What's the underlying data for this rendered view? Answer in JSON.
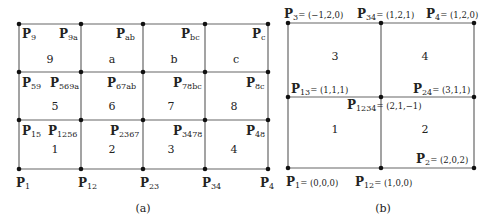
{
  "figure_a": {
    "caption": "(a)",
    "x": [
      19,
      81,
      143,
      205,
      268
    ],
    "y": [
      24,
      72,
      120,
      169
    ],
    "cells": [
      {
        "label": "9",
        "x": 50,
        "y": 59
      },
      {
        "label": "a",
        "x": 112,
        "y": 59
      },
      {
        "label": "b",
        "x": 174,
        "y": 59
      },
      {
        "label": "c",
        "x": 236,
        "y": 59
      },
      {
        "label": "5",
        "x": 55,
        "y": 106
      },
      {
        "label": "6",
        "x": 112,
        "y": 106
      },
      {
        "label": "7",
        "x": 171,
        "y": 106
      },
      {
        "label": "8",
        "x": 234,
        "y": 106
      },
      {
        "label": "1",
        "x": 55,
        "y": 149
      },
      {
        "label": "2",
        "x": 112,
        "y": 149
      },
      {
        "label": "3",
        "x": 171,
        "y": 149
      },
      {
        "label": "4",
        "x": 234,
        "y": 149
      }
    ],
    "points": [
      {
        "base": "P",
        "sub": "9",
        "x": 22,
        "y": 27
      },
      {
        "base": "P",
        "sub": "9a",
        "x": 59,
        "y": 27
      },
      {
        "base": "P",
        "sub": "ab",
        "x": 116,
        "y": 27
      },
      {
        "base": "P",
        "sub": "bc",
        "x": 181,
        "y": 27
      },
      {
        "base": "P",
        "sub": "c",
        "x": 252,
        "y": 27
      },
      {
        "base": "P",
        "sub": "59",
        "x": 22,
        "y": 76
      },
      {
        "base": "P",
        "sub": "569a",
        "x": 50,
        "y": 76
      },
      {
        "base": "P",
        "sub": "67ab",
        "x": 107,
        "y": 76
      },
      {
        "base": "P",
        "sub": "78bc",
        "x": 173,
        "y": 76
      },
      {
        "base": "P",
        "sub": "8c",
        "x": 246,
        "y": 76
      },
      {
        "base": "P",
        "sub": "15",
        "x": 22,
        "y": 124
      },
      {
        "base": "P",
        "sub": "1256",
        "x": 48,
        "y": 124
      },
      {
        "base": "P",
        "sub": "2367",
        "x": 110,
        "y": 124
      },
      {
        "base": "P",
        "sub": "3478",
        "x": 173,
        "y": 124
      },
      {
        "base": "P",
        "sub": "48",
        "x": 246,
        "y": 124
      },
      {
        "base": "P",
        "sub": "1",
        "x": 16,
        "y": 176
      },
      {
        "base": "P",
        "sub": "12",
        "x": 78,
        "y": 176
      },
      {
        "base": "P",
        "sub": "23",
        "x": 140,
        "y": 176
      },
      {
        "base": "P",
        "sub": "34",
        "x": 202,
        "y": 176
      },
      {
        "base": "P",
        "sub": "4",
        "x": 260,
        "y": 176
      }
    ]
  },
  "figure_b": {
    "caption": "(b)",
    "x": [
      288,
      381,
      474
    ],
    "y": [
      23,
      97,
      168
    ],
    "cells": [
      {
        "label": "3",
        "x": 335,
        "y": 56
      },
      {
        "label": "4",
        "x": 425,
        "y": 56
      },
      {
        "label": "1",
        "x": 335,
        "y": 129
      },
      {
        "label": "2",
        "x": 425,
        "y": 129
      }
    ],
    "points": [
      {
        "base": "P",
        "sub": "3",
        "coord": "= (−1,2,0)",
        "x": 284,
        "y": 7
      },
      {
        "base": "P",
        "sub": "34",
        "coord": "= (1,2,1)",
        "x": 357,
        "y": 7
      },
      {
        "base": "P",
        "sub": "4",
        "coord": "= (1,2,0)",
        "x": 426,
        "y": 7
      },
      {
        "base": "P",
        "sub": "13",
        "coord": "= (1,1,1)",
        "x": 291,
        "y": 82
      },
      {
        "base": "P",
        "sub": "24",
        "coord": "= (3,1,1)",
        "x": 413,
        "y": 82
      },
      {
        "base": "P",
        "sub": "1234",
        "coord": "= (2,1,−1)",
        "x": 347,
        "y": 98
      },
      {
        "base": "P",
        "sub": "2",
        "coord": "= (2,0,2)",
        "x": 416,
        "y": 152
      },
      {
        "base": "P",
        "sub": "1",
        "coord": "= (0,0,0)",
        "x": 286,
        "y": 175
      },
      {
        "base": "P",
        "sub": "12",
        "coord": "= (1,0,0)",
        "x": 355,
        "y": 175
      }
    ]
  },
  "colors": {
    "line": "#666666",
    "dot": "#111111",
    "text": "#222222"
  }
}
